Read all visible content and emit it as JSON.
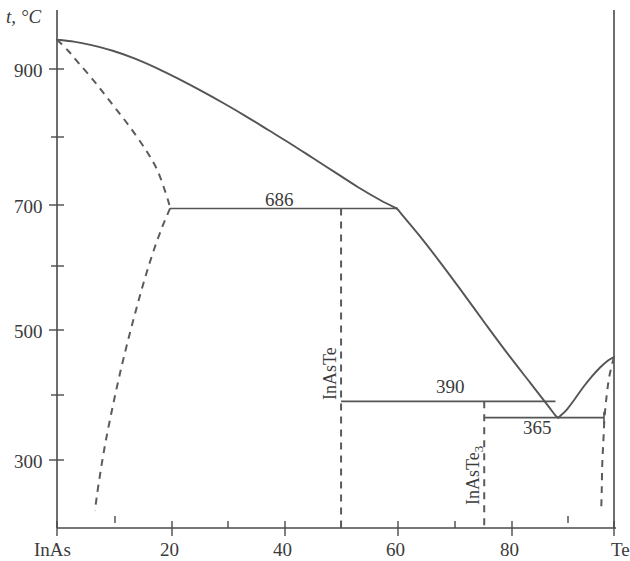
{
  "figure": {
    "kind": "binary-phase-diagram",
    "axis_title_y": "t, °C",
    "axis_title_x": ""
  },
  "chart_data": {
    "type": "line",
    "title": "",
    "subtitle": "",
    "xlabel": "",
    "ylabel": "t, °C",
    "xlim": [
      0,
      100
    ],
    "ylim": [
      215,
      980
    ],
    "grid": false,
    "legend": "none",
    "x_tick_labels": [
      "InAs",
      "20",
      "40",
      "60",
      "80",
      "Te"
    ],
    "x_tick_values": [
      0,
      20,
      40,
      60,
      80,
      100
    ],
    "x_minor_ticks": [
      10,
      30,
      50,
      70,
      90
    ],
    "y_tick_labels": [
      "900",
      "700",
      "500",
      "300"
    ],
    "y_tick_values": [
      900,
      700,
      500,
      300
    ],
    "y_minor_ticks": [
      800,
      600,
      400
    ],
    "annotations": [
      {
        "text": "686",
        "x": 37,
        "y": 700,
        "note": "eutectic isotherm InAs + InAsTe"
      },
      {
        "text": "390",
        "x": 63,
        "y": 404,
        "note": "peritectic/eutectic isotherm InAsTe + InAsTe3"
      },
      {
        "text": "365",
        "x": 83,
        "y": 352,
        "note": "eutectic isotherm InAsTe3 + Te"
      },
      {
        "text": "InAsTe",
        "x": 51,
        "y": 500,
        "note": "compound vertical line, rotated"
      },
      {
        "text": "InAsTe3",
        "x": 76.7,
        "y": 320,
        "note": "compound vertical line, rotated"
      }
    ],
    "series": [
      {
        "name": "liquidus-InAs-branch",
        "style": "solid",
        "points": [
          [
            0,
            945
          ],
          [
            3,
            942
          ],
          [
            6,
            937
          ],
          [
            10,
            928
          ],
          [
            14,
            916
          ],
          [
            18,
            901
          ],
          [
            22,
            884
          ],
          [
            26,
            866
          ],
          [
            30,
            847
          ],
          [
            34,
            827
          ],
          [
            38,
            806
          ],
          [
            42,
            785
          ],
          [
            46,
            763
          ],
          [
            50,
            741
          ],
          [
            54,
            719
          ],
          [
            58,
            699
          ],
          [
            61,
            686
          ]
        ]
      },
      {
        "name": "liquidus-InAsTe-branch",
        "style": "solid",
        "points": [
          [
            61,
            686
          ],
          [
            65,
            645
          ],
          [
            69,
            601
          ],
          [
            73,
            555
          ],
          [
            77,
            508
          ],
          [
            81,
            462
          ],
          [
            85,
            418
          ],
          [
            88,
            385
          ],
          [
            89.5,
            368
          ],
          [
            90,
            365
          ]
        ]
      },
      {
        "name": "liquidus-Te-branch",
        "style": "solid",
        "points": [
          [
            90,
            365
          ],
          [
            91.5,
            377
          ],
          [
            93,
            394
          ],
          [
            94.5,
            412
          ],
          [
            96,
            428
          ],
          [
            97.5,
            442
          ],
          [
            99,
            453
          ],
          [
            100,
            458
          ]
        ]
      },
      {
        "name": "solidus-InAs",
        "style": "dashed",
        "points": [
          [
            0,
            945
          ],
          [
            2,
            928
          ],
          [
            4,
            908
          ],
          [
            7,
            878
          ],
          [
            10,
            845
          ],
          [
            13,
            812
          ],
          [
            16,
            775
          ],
          [
            18,
            745
          ],
          [
            19.5,
            710
          ],
          [
            20.3,
            688
          ]
        ]
      },
      {
        "name": "solvus-InAs",
        "style": "dashed",
        "points": [
          [
            20.3,
            686
          ],
          [
            19,
            660
          ],
          [
            17.5,
            625
          ],
          [
            16,
            585
          ],
          [
            14.5,
            540
          ],
          [
            13,
            492
          ],
          [
            11.5,
            440
          ],
          [
            10,
            382
          ],
          [
            8.6,
            322
          ],
          [
            7.5,
            265
          ],
          [
            6.8,
            222
          ]
        ]
      },
      {
        "name": "solvus-Te",
        "style": "dashed",
        "points": [
          [
            100,
            458
          ],
          [
            99.2,
            430
          ],
          [
            98.7,
            400
          ],
          [
            98.3,
            365
          ],
          [
            98.1,
            330
          ],
          [
            97.9,
            295
          ],
          [
            97.8,
            255
          ],
          [
            97.7,
            222
          ]
        ]
      }
    ],
    "invariant_lines": [
      {
        "temperature": 686,
        "x_from": 20.3,
        "x_to": 61,
        "label": "686"
      },
      {
        "temperature": 390,
        "x_from": 51,
        "x_to": 89.5,
        "label": "390"
      },
      {
        "temperature": 365,
        "x_from": 76.7,
        "x_to": 98.2,
        "label": "365"
      }
    ],
    "compound_lines": [
      {
        "label": "InAsTe",
        "x": 51,
        "t_top": 686,
        "t_bottom": 222
      },
      {
        "label": "InAsTe3",
        "x": 76.7,
        "t_top": 390,
        "t_bottom": 222
      }
    ]
  },
  "labels": {
    "y_axis_title": "t, °C",
    "y_ticks": [
      "900",
      "700",
      "500",
      "300"
    ],
    "x_ticks": [
      "InAs",
      "20",
      "40",
      "60",
      "80",
      "Te"
    ],
    "iso_686": "686",
    "iso_390": "390",
    "iso_365": "365",
    "compound_1": "InAsTe",
    "compound_2_base": "InAsTe",
    "compound_2_sub": "3"
  }
}
